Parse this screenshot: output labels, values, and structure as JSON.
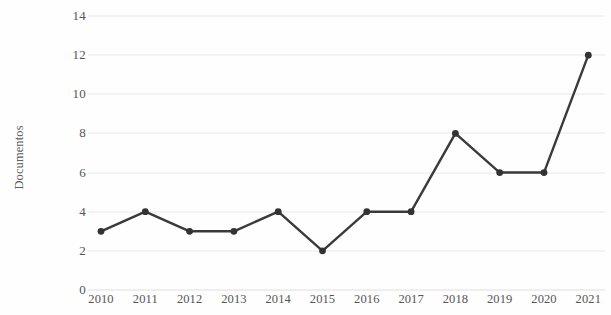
{
  "chart_data": {
    "type": "line",
    "title": "",
    "subtitle": "",
    "xlabel": "",
    "ylabel": "Documentos",
    "categories": [
      "2010",
      "2011",
      "2012",
      "2013",
      "2014",
      "2015",
      "2016",
      "2017",
      "2018",
      "2019",
      "2020",
      "2021"
    ],
    "values": [
      3,
      4,
      3,
      3,
      4,
      2,
      4,
      4,
      8,
      6,
      6,
      12
    ],
    "series": [
      {
        "name": "Documentos",
        "values": [
          3,
          4,
          3,
          3,
          4,
          2,
          4,
          4,
          8,
          6,
          6,
          12
        ]
      }
    ],
    "y_ticks": [
      0,
      2,
      4,
      6,
      8,
      10,
      12,
      14
    ],
    "y_tick_labels": [
      "0",
      "2",
      "4",
      "6",
      "8",
      "10",
      "12",
      "14"
    ],
    "ylim": [
      0,
      14
    ],
    "xlim": [
      "2010",
      "2021"
    ],
    "grid": "horizontal",
    "legend": "none",
    "annotations": [],
    "marker": "circle",
    "colors": {
      "line": "#3a3a3a",
      "marker": "#333333",
      "gridline": "#e8e8e8",
      "axis_text": "#555555",
      "background": "#fefefe"
    }
  }
}
